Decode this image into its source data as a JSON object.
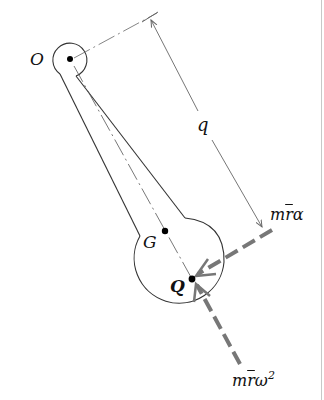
{
  "figure": {
    "labels": {
      "pivot": "O",
      "distance": "q",
      "center_of_mass": "G",
      "center_of_percussion": "Q",
      "tangential_force": {
        "m": "m",
        "r": "r",
        "sym": "α"
      },
      "normal_force": {
        "m": "m",
        "r": "r",
        "sym": "ω",
        "exp": "2"
      }
    },
    "colors": {
      "outline": "#333333",
      "centerline": "#555555",
      "dimension": "#666666",
      "force_vector": "#777777",
      "point": "#000000"
    }
  }
}
